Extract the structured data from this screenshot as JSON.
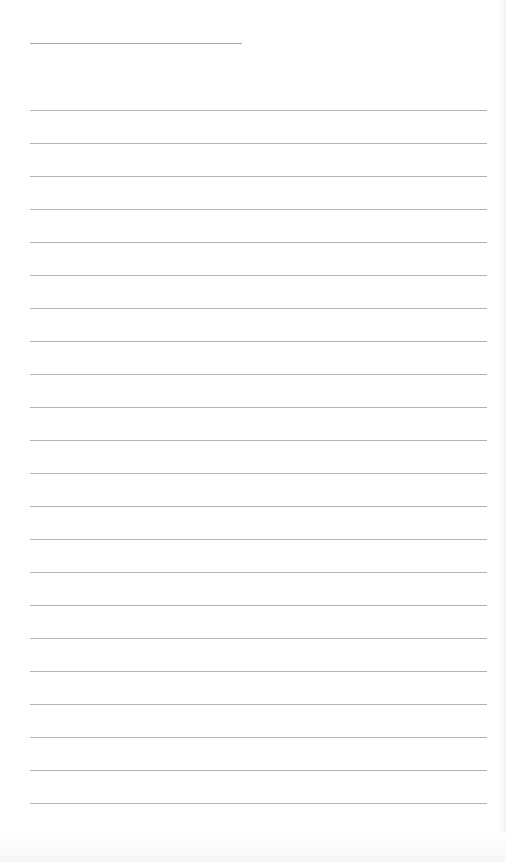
{
  "sheet": {
    "type": "lined-paper",
    "background_color": "#ffffff",
    "line_color": "#9a9a9a",
    "title_line": {
      "x": 30,
      "y": 43,
      "width": 212
    },
    "ruled_lines": {
      "x": 30,
      "width": 457,
      "first_y": 110,
      "spacing": 33,
      "count": 22
    },
    "text_content": []
  }
}
